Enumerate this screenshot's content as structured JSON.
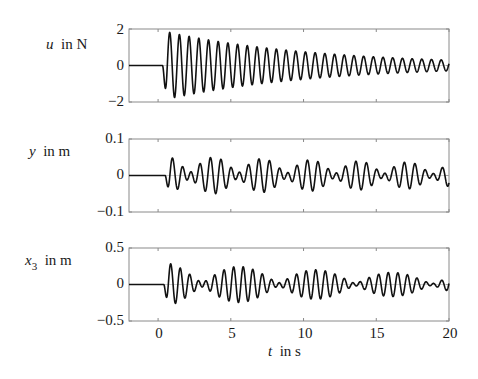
{
  "chart_data": {
    "type": "line",
    "layout": "3 vertically stacked subplots sharing the time axis",
    "xlabel": {
      "var": "t",
      "unit": "in s"
    },
    "xlim": [
      -2,
      20
    ],
    "xticks": [
      0,
      5,
      10,
      15,
      20
    ],
    "xtick_labels": [
      "0",
      "5",
      "10",
      "15",
      "20"
    ],
    "grid": false,
    "legend": null,
    "subplots": [
      {
        "id": "u",
        "ylabel": {
          "var": "u",
          "sub": "",
          "unit": "in N"
        },
        "ylim": [
          -2,
          2
        ],
        "yticks": [
          -2,
          0,
          2
        ],
        "ytick_labels": [
          "−2",
          "0",
          "2"
        ],
        "description": "Exponentially decaying sinusoidal input; zero until t≈0.3 s, first swing to about −1.9, peak ≈+1.9, decaying to about ±0.3 at t=20 s; ≈1.5 Hz.",
        "model": {
          "onset": 0.3,
          "components": [
            {
              "amp": 1.9,
              "freq": 1.5,
              "phase": 3.14159,
              "decay": 0.095
            }
          ]
        },
        "envelope_points": {
          "t": [
            0.5,
            2,
            5,
            10,
            15,
            20
          ],
          "amplitude": [
            1.9,
            1.65,
            1.2,
            0.75,
            0.45,
            0.3
          ]
        }
      },
      {
        "id": "y",
        "ylabel": {
          "var": "y",
          "sub": "",
          "unit": "in m"
        },
        "ylim": [
          -0.1,
          0.1
        ],
        "yticks": [
          -0.1,
          0,
          0.1
        ],
        "ytick_labels": [
          "−0.1",
          "0",
          "0.1"
        ],
        "description": "Beating oscillation around zero with amplitude ≈0.05 m; zero until t≈0.5 s, largest excursion ≈−0.06 near t≈1.5 s, slowly decaying to ≈0.03 at t=20 s.",
        "model": {
          "onset": 0.5,
          "components": [
            {
              "amp": 0.032,
              "freq": 1.5,
              "phase": 3.6,
              "decay": 0.025
            },
            {
              "amp": 0.022,
              "freq": 1.2,
              "phase": 3.6,
              "decay": 0.02
            }
          ]
        },
        "envelope_points": {
          "t": [
            1.5,
            3,
            5,
            8,
            12,
            16,
            20
          ],
          "amplitude": [
            0.06,
            0.055,
            0.05,
            0.048,
            0.04,
            0.04,
            0.03
          ]
        }
      },
      {
        "id": "x3",
        "ylabel": {
          "var": "x",
          "sub": "3",
          "unit": "in m"
        },
        "ylim": [
          -0.5,
          0.5
        ],
        "yticks": [
          -0.5,
          0,
          0.5
        ],
        "ytick_labels": [
          "−0.5",
          "0",
          "0.5"
        ],
        "description": "Beating oscillation with amplitude peaks ≈0.33 at t≈2 s, ≈0.25 at t≈7.5 s, ≈0.2 at t≈12 s, ≈0.17 at t≈17.5 s; near-minima around t≈4.5, 9.5, 14.5 s.",
        "model": {
          "onset": 0.4,
          "components": [
            {
              "amp": 0.17,
              "freq": 1.6,
              "phase": 3.4,
              "decay": 0.04
            },
            {
              "amp": 0.13,
              "freq": 1.41,
              "phase": 3.4,
              "decay": 0.035
            }
          ]
        },
        "envelope_points": {
          "t": [
            2,
            4.5,
            7.5,
            9.8,
            12,
            14.5,
            17.5,
            20
          ],
          "amplitude": [
            0.33,
            0.06,
            0.25,
            0.04,
            0.2,
            0.04,
            0.17,
            0.1
          ]
        }
      }
    ],
    "sample_step": 0.02
  },
  "style": {
    "line_color": "#111111",
    "axis_color": "#8a8a8a",
    "zero_line_color": "#b0b0b0"
  }
}
